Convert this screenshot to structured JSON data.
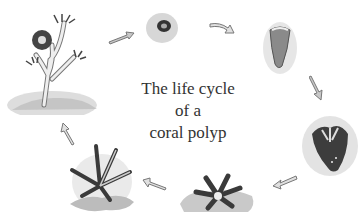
{
  "title": {
    "line1": "The life cycle",
    "line2": "of a",
    "line3": "coral polyp"
  },
  "stages": [
    {
      "name": "egg-larva",
      "position": "top-center"
    },
    {
      "name": "planula-larva",
      "position": "top-right"
    },
    {
      "name": "settling-polyp",
      "position": "right"
    },
    {
      "name": "young-polyp",
      "position": "bottom-center"
    },
    {
      "name": "polyp-with-tentacles",
      "position": "bottom-left"
    },
    {
      "name": "coral-colony",
      "position": "top-left"
    }
  ],
  "colors": {
    "ink": "#333333",
    "shade": "#9a9a9a",
    "light_shade": "#d8d8d8",
    "arrow_fill": "#c8c8c8",
    "arrow_outline": "#777777"
  }
}
